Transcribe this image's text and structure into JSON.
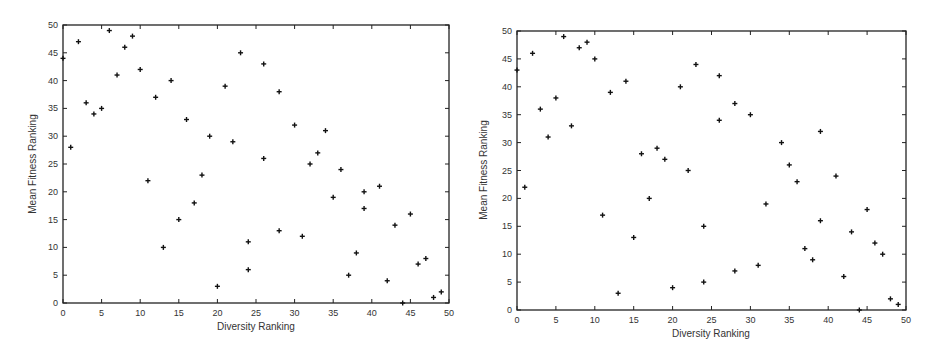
{
  "chart_data": [
    {
      "type": "scatter",
      "title": "",
      "xlabel": "Diversity Ranking",
      "ylabel": "Mean Fitness Ranking",
      "xlim": [
        0,
        50
      ],
      "ylim": [
        0,
        50
      ],
      "xticks": [
        0,
        5,
        10,
        15,
        20,
        25,
        30,
        35,
        40,
        45,
        50
      ],
      "yticks": [
        0,
        5,
        10,
        15,
        20,
        25,
        30,
        35,
        40,
        45,
        50
      ],
      "grid": false,
      "marker": "+",
      "points": [
        [
          0,
          44
        ],
        [
          1,
          28
        ],
        [
          2,
          47
        ],
        [
          3,
          36
        ],
        [
          4,
          34
        ],
        [
          5,
          35
        ],
        [
          6,
          49
        ],
        [
          7,
          41
        ],
        [
          8,
          46
        ],
        [
          9,
          48
        ],
        [
          10,
          42
        ],
        [
          11,
          22
        ],
        [
          12,
          37
        ],
        [
          13,
          10
        ],
        [
          14,
          40
        ],
        [
          15,
          15
        ],
        [
          16,
          33
        ],
        [
          17,
          18
        ],
        [
          18,
          23
        ],
        [
          19,
          30
        ],
        [
          20,
          3
        ],
        [
          21,
          39
        ],
        [
          22,
          29
        ],
        [
          23,
          45
        ],
        [
          24,
          11
        ],
        [
          24,
          6
        ],
        [
          26,
          43
        ],
        [
          26,
          26
        ],
        [
          28,
          38
        ],
        [
          28,
          13
        ],
        [
          30,
          32
        ],
        [
          31,
          12
        ],
        [
          32,
          25
        ],
        [
          33,
          27
        ],
        [
          34,
          31
        ],
        [
          35,
          19
        ],
        [
          36,
          24
        ],
        [
          37,
          5
        ],
        [
          38,
          9
        ],
        [
          39,
          20
        ],
        [
          39,
          17
        ],
        [
          41,
          21
        ],
        [
          42,
          4
        ],
        [
          43,
          14
        ],
        [
          44,
          0
        ],
        [
          45,
          16
        ],
        [
          46,
          7
        ],
        [
          47,
          8
        ],
        [
          48,
          1
        ],
        [
          49,
          2
        ]
      ]
    },
    {
      "type": "scatter",
      "title": "",
      "xlabel": "Diversity Ranking",
      "ylabel": "Mean Fitness Ranking",
      "xlim": [
        0,
        50
      ],
      "ylim": [
        0,
        50
      ],
      "xticks": [
        0,
        5,
        10,
        15,
        20,
        25,
        30,
        35,
        40,
        45,
        50
      ],
      "yticks": [
        0,
        5,
        10,
        15,
        20,
        25,
        30,
        35,
        40,
        45,
        50
      ],
      "grid": false,
      "marker": "+",
      "points": [
        [
          0,
          43
        ],
        [
          1,
          22
        ],
        [
          2,
          46
        ],
        [
          3,
          36
        ],
        [
          4,
          31
        ],
        [
          5,
          38
        ],
        [
          6,
          49
        ],
        [
          7,
          33
        ],
        [
          8,
          47
        ],
        [
          9,
          48
        ],
        [
          10,
          45
        ],
        [
          11,
          17
        ],
        [
          12,
          39
        ],
        [
          13,
          3
        ],
        [
          14,
          41
        ],
        [
          15,
          13
        ],
        [
          16,
          28
        ],
        [
          17,
          20
        ],
        [
          18,
          29
        ],
        [
          19,
          27
        ],
        [
          20,
          4
        ],
        [
          21,
          40
        ],
        [
          22,
          25
        ],
        [
          23,
          44
        ],
        [
          24,
          15
        ],
        [
          24,
          5
        ],
        [
          26,
          42
        ],
        [
          26,
          34
        ],
        [
          28,
          37
        ],
        [
          28,
          7
        ],
        [
          30,
          35
        ],
        [
          31,
          8
        ],
        [
          32,
          19
        ],
        [
          34,
          30
        ],
        [
          35,
          26
        ],
        [
          36,
          23
        ],
        [
          37,
          11
        ],
        [
          38,
          9
        ],
        [
          39,
          32
        ],
        [
          39,
          16
        ],
        [
          41,
          24
        ],
        [
          42,
          6
        ],
        [
          43,
          14
        ],
        [
          44,
          0
        ],
        [
          45,
          18
        ],
        [
          46,
          12
        ],
        [
          47,
          10
        ],
        [
          48,
          2
        ],
        [
          49,
          1
        ]
      ]
    }
  ],
  "charts": [
    {
      "xlabel": "Diversity Ranking",
      "ylabel": "Mean Fitness Ranking"
    },
    {
      "xlabel": "Diversity Ranking",
      "ylabel": "Mean Fitness Ranking"
    }
  ]
}
